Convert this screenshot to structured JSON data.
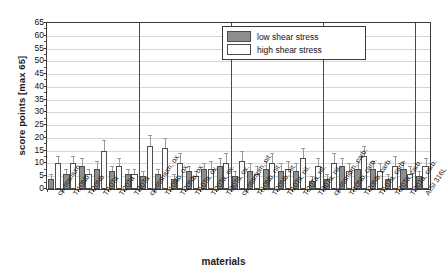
{
  "chart_data": {
    "type": "bar",
    "title": "",
    "xlabel": "materials",
    "ylabel": "score points [max 65]",
    "ylim": [
      0,
      65
    ],
    "ytick_step": 5,
    "yticks": [
      0,
      5,
      10,
      15,
      20,
      25,
      30,
      35,
      40,
      45,
      50,
      55,
      60,
      65
    ],
    "grid": true,
    "legend_position": "top-right",
    "legend": [
      "low shear stress",
      "high shear stress"
    ],
    "group_separators_after": [
      6,
      12,
      18,
      24
    ],
    "categories": [
      "cp-titanium",
      "Ti10Nb",
      "Ti20Nb",
      "Ti10Ta",
      "Ti20Ta",
      "Ti30Ta",
      "cp-titanium, ox.",
      "Ti10Nb, ox.",
      "Ti20Nb, ox.",
      "Ti10Ta, ox.",
      "Ti20Ta, ox.",
      "Ti30Ta, ox.",
      "cp-titanium, nit.",
      "Ti10Nb, nit.",
      "Ti20Nb, nit.",
      "Ti10Ta, nit.",
      "Ti20Ta, nit.",
      "Ti30Ta, nit.",
      "cp-titanium, carb.",
      "Ti10Nb, carb.",
      "Ti20Nb, carb.",
      "Ti10Ta, carb.",
      "Ti20Ta, carb.",
      "Ti30Ta, carb.",
      "AISI 316L"
    ],
    "series": [
      {
        "name": "low shear stress",
        "color": "#8e8e8e",
        "values": [
          4,
          6,
          9,
          8,
          7,
          6,
          5,
          6,
          4,
          7,
          8,
          9,
          5,
          7,
          8,
          7,
          7,
          3,
          4,
          9,
          8,
          8,
          4,
          8,
          5
        ],
        "errors": [
          2,
          2,
          3,
          3,
          2,
          2,
          2,
          2,
          2,
          2,
          2,
          3,
          2,
          3,
          3,
          3,
          3,
          2,
          2,
          3,
          3,
          3,
          2,
          3,
          2
        ]
      },
      {
        "name": "high shear stress",
        "color": "#fbfbfb",
        "values": [
          10,
          10,
          6,
          15,
          9,
          6,
          17,
          16,
          10,
          5,
          8,
          10,
          11,
          6,
          10,
          8,
          12,
          9,
          10,
          7,
          13,
          7,
          9,
          6,
          9
        ],
        "errors": [
          3,
          3,
          2,
          4,
          3,
          2,
          4,
          4,
          4,
          2,
          3,
          4,
          4,
          3,
          4,
          3,
          4,
          3,
          4,
          3,
          4,
          3,
          4,
          3,
          3
        ]
      }
    ]
  }
}
